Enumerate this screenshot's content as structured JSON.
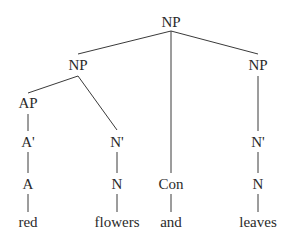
{
  "diagram": {
    "type": "syntax-tree",
    "line_color": "#3a3a3a",
    "text_color": "#2a2a2a",
    "nodes": {
      "root_np": "NP",
      "left_np": "NP",
      "right_np": "NP",
      "ap": "AP",
      "a_bar": "A'",
      "a": "A",
      "left_n_bar": "N'",
      "left_n": "N",
      "con": "Con",
      "right_n_bar": "N'",
      "right_n": "N"
    },
    "words": {
      "red": "red",
      "flowers": "flowers",
      "and": "and",
      "leaves": "leaves"
    }
  }
}
